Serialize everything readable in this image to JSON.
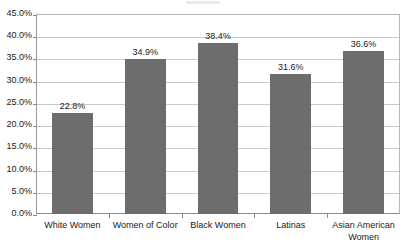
{
  "chart_data": {
    "type": "bar",
    "title": "",
    "subtitle": "",
    "xlabel": "",
    "ylabel": "",
    "categories": [
      "White Women",
      "Women of Color",
      "Black Women",
      "Latinas",
      "Asian American Women"
    ],
    "values": [
      22.8,
      34.9,
      38.4,
      31.6,
      36.6
    ],
    "value_labels": [
      "22.8%",
      "34.9%",
      "38.4%",
      "31.6%",
      "36.6%"
    ],
    "ylim": [
      0,
      45
    ],
    "ytick_values": [
      0,
      5,
      10,
      15,
      20,
      25,
      30,
      35,
      40,
      45
    ],
    "ytick_labels": [
      "0.0%",
      "5.0%",
      "10.0%",
      "15.0%",
      "20.0%",
      "25.0%",
      "30.0%",
      "35.0%",
      "40.0%",
      "45.0%"
    ],
    "grid": true,
    "legend": "none",
    "legend_position": "none",
    "series": [
      {
        "name": "",
        "values": [
          22.8,
          34.9,
          38.4,
          31.6,
          36.6
        ]
      }
    ]
  },
  "style": {
    "bar_color": "#6d6d6d",
    "gridline_color": "#c9c9c9",
    "axis_color": "#8a8a8a",
    "plot_border_color": "#b8b8b8",
    "text_color": "#1a1a1a",
    "background": "#ffffff"
  }
}
